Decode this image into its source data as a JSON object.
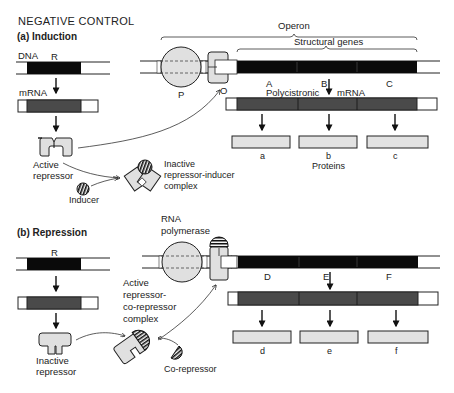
{
  "title": "NEGATIVE CONTROL",
  "colors": {
    "dna_gene": "#0a0a0a",
    "mrna": "#4a4a4a",
    "protein": "#e2e2e2",
    "repressor": "#e0e0e0",
    "line": "#222222"
  },
  "induction": {
    "heading": "(a)  Induction",
    "dna_label": "DNA",
    "regulator_gene": "R",
    "mrna_label": "mRNA",
    "active_repressor": [
      "Active",
      "repressor"
    ],
    "inducer": "Inducer",
    "complex": [
      "Inactive",
      "repressor-inducer",
      "complex"
    ],
    "operon_label": "Operon",
    "structural_genes_label": "Structural genes",
    "promoter": "P",
    "operator": "O",
    "genes": [
      "A",
      "B",
      "C"
    ],
    "polycistronic": "Polycistronic",
    "polycistronic_mrna": "mRNA",
    "proteins": [
      "a",
      "b",
      "c"
    ],
    "proteins_label": "Proteins"
  },
  "repression": {
    "heading": "(b)  Repression",
    "regulator_gene": "R",
    "rna_polymerase": [
      "RNA",
      "polymerase"
    ],
    "inactive_repressor": [
      "Inactive",
      "repressor"
    ],
    "complex": [
      "Active",
      "repressor-",
      "co-repressor",
      "complex"
    ],
    "corepressor": "Co-repressor",
    "genes": [
      "D",
      "E",
      "F"
    ],
    "proteins": [
      "d",
      "e",
      "f"
    ]
  }
}
